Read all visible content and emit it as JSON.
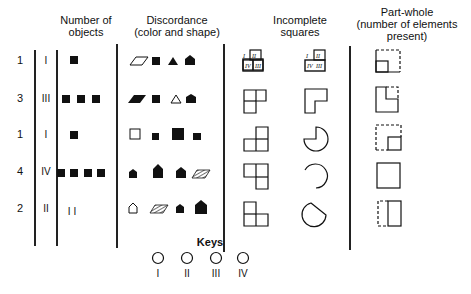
{
  "headers": {
    "number_of_objects": [
      "Number of",
      "objects"
    ],
    "discordance": [
      "Discordance",
      "(color and shape)"
    ],
    "incomplete_squares": [
      "Incomplete",
      "squares"
    ],
    "part_whole": [
      "Part-whole",
      "(number of elements",
      "present)"
    ]
  },
  "rows": [
    {
      "count": "1",
      "roman": "I",
      "objects": 1,
      "objects_label": "",
      "discordance": [
        "open-parallelogram",
        "filled-square",
        "filled-triangle",
        "filled-pentagon"
      ],
      "incomplete_a": "labeled-four-squares",
      "incomplete_b": "labeled-three-squares",
      "part_whole": "dashed-square-one-element"
    },
    {
      "count": "3",
      "roman": "III",
      "objects": 3,
      "objects_label": "",
      "discordance": [
        "filled-parallelogram",
        "filled-square",
        "open-triangle",
        "filled-pentagon"
      ],
      "incomplete_a": "three-squares-L",
      "incomplete_b": "L-shape",
      "part_whole": "square-missing-corner-dashed"
    },
    {
      "count": "1",
      "roman": "I",
      "objects": 1,
      "objects_label": "",
      "discordance": [
        "open-square",
        "small-filled-square",
        "large-filled-square",
        "small-filled-square"
      ],
      "incomplete_a": "three-squares-inverted-L",
      "incomplete_b": "three-quarter-circle",
      "part_whole": "dashed-square-one-element-bottom-right"
    },
    {
      "count": "4",
      "roman": "IV",
      "objects": 4,
      "objects_label": "",
      "discordance": [
        "small-filled-pentagon",
        "large-filled-pentagon",
        "filled-pentagon",
        "hatched-parallelogram"
      ],
      "incomplete_a": "three-squares-step",
      "incomplete_b": "open-arc",
      "part_whole": "complete-square"
    },
    {
      "count": "2",
      "roman": "II",
      "objects": 0,
      "objects_label": "I I",
      "discordance": [
        "open-pentagon",
        "hatched-parallelogram",
        "filled-pentagon",
        "large-filled-pentagon"
      ],
      "incomplete_a": "three-squares-step-down",
      "incomplete_b": "circle-with-corner",
      "part_whole": "dashed-half-solid-half"
    }
  ],
  "keys": {
    "title": "Keys",
    "items": [
      {
        "label": "I",
        "icon": "circle-icon"
      },
      {
        "label": "II",
        "icon": "circle-icon"
      },
      {
        "label": "III",
        "icon": "circle-icon"
      },
      {
        "label": "IV",
        "icon": "circle-icon"
      }
    ]
  },
  "labels": {
    "r1_a": [
      "I",
      "II",
      "III",
      "IV"
    ],
    "r1_b": [
      "I",
      "II",
      "IV",
      "III"
    ]
  },
  "colors": {
    "ink": "#111111",
    "background": "#ffffff"
  }
}
